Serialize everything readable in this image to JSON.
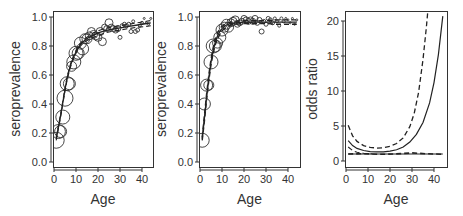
{
  "figure": {
    "width": 463,
    "height": 216,
    "background": "#ffffff",
    "ink": "#333333",
    "panel_count": 3
  },
  "chart_data": [
    {
      "type": "scatter",
      "panel": "left",
      "title": "",
      "xlabel": "Age",
      "ylabel": "seroprevalence",
      "xlim": [
        -1,
        44.5
      ],
      "ylim": [
        -0.04,
        1.07
      ],
      "xticks": [
        0,
        10,
        20,
        30,
        40
      ],
      "xtick_labels": [
        "0",
        "10",
        "20",
        "30",
        "40"
      ],
      "yticks": [
        0.0,
        0.2,
        0.4,
        0.6,
        0.8,
        1.0
      ],
      "ytick_labels": [
        "0.0",
        "0.2",
        "0.4",
        "0.6",
        "0.8",
        "1.0"
      ],
      "grid": false,
      "legend": null,
      "box": {
        "x0": 53,
        "y0": 11,
        "x1": 153,
        "y1": 167
      },
      "xmap": {
        "v0": 0,
        "p0": 54,
        "v1": 40,
        "p1": 142
      },
      "ymap": {
        "v0": 0,
        "p0": 162,
        "v1": 1,
        "p1": 17
      },
      "points": {
        "note": "open circles, radius proportional to sample size",
        "x": [
          1,
          2,
          3,
          4,
          5,
          6,
          7,
          8,
          9,
          10,
          11,
          12,
          13,
          14,
          15,
          16,
          17,
          18,
          19,
          20,
          21,
          22,
          23,
          24,
          25,
          26,
          27,
          28,
          29,
          30,
          31,
          32,
          33,
          34,
          35,
          36,
          37,
          38,
          39,
          40,
          41,
          42,
          43,
          44
        ],
        "y": [
          0.15,
          0.21,
          0.21,
          0.31,
          0.44,
          0.54,
          0.54,
          0.66,
          0.69,
          0.75,
          0.75,
          0.82,
          0.78,
          0.85,
          0.85,
          0.87,
          0.9,
          0.88,
          0.87,
          0.86,
          0.9,
          0.83,
          0.93,
          0.92,
          0.96,
          0.93,
          0.92,
          0.91,
          0.92,
          0.86,
          0.94,
          0.95,
          0.94,
          0.95,
          0.9,
          0.97,
          0.9,
          0.91,
          0.94,
          0.96,
          0.99,
          0.96,
          0.95,
          0.99
        ],
        "r": [
          8,
          7,
          6,
          7,
          8,
          7,
          6,
          5,
          7,
          7,
          6,
          6,
          6,
          5,
          5,
          4,
          4,
          4,
          4,
          4,
          4,
          4,
          3,
          3,
          4,
          3,
          3,
          3,
          3,
          2,
          2,
          2,
          2,
          2,
          2,
          1.5,
          2,
          2,
          1.5,
          1.5,
          1,
          1,
          1,
          1
        ]
      },
      "series": [
        {
          "name": "fit",
          "style": "solid",
          "width": 1.3,
          "x": [
            1,
            2,
            3,
            4,
            5,
            6,
            7,
            8,
            10,
            12,
            14,
            16,
            18,
            20,
            23,
            26,
            30,
            34,
            38,
            42,
            44
          ],
          "y": [
            0.16,
            0.24,
            0.32,
            0.41,
            0.5,
            0.58,
            0.64,
            0.69,
            0.76,
            0.81,
            0.84,
            0.86,
            0.875,
            0.89,
            0.905,
            0.915,
            0.925,
            0.935,
            0.945,
            0.955,
            0.96
          ]
        },
        {
          "name": "lower",
          "style": "dashed",
          "width": 1.1,
          "x": [
            1,
            2,
            3,
            4,
            5,
            6,
            7,
            8,
            10,
            12,
            14,
            16,
            18,
            20,
            23,
            26,
            30,
            34,
            38,
            42,
            44
          ],
          "y": [
            0.15,
            0.23,
            0.31,
            0.4,
            0.49,
            0.57,
            0.63,
            0.68,
            0.75,
            0.8,
            0.83,
            0.845,
            0.86,
            0.87,
            0.89,
            0.9,
            0.91,
            0.92,
            0.93,
            0.935,
            0.94
          ]
        },
        {
          "name": "upper",
          "style": "dashed",
          "width": 1.1,
          "x": [
            1,
            2,
            3,
            4,
            5,
            6,
            7,
            8,
            10,
            12,
            14,
            16,
            18,
            20,
            23,
            26,
            30,
            34,
            38,
            42,
            44
          ],
          "y": [
            0.17,
            0.25,
            0.33,
            0.42,
            0.51,
            0.59,
            0.65,
            0.7,
            0.77,
            0.82,
            0.85,
            0.87,
            0.89,
            0.905,
            0.92,
            0.93,
            0.94,
            0.95,
            0.96,
            0.97,
            0.975
          ]
        }
      ]
    },
    {
      "type": "scatter",
      "panel": "middle",
      "title": "",
      "xlabel": "Age",
      "ylabel": "seroprevalence",
      "xlim": [
        -1,
        44.5
      ],
      "ylim": [
        -0.04,
        1.07
      ],
      "xticks": [
        0,
        10,
        20,
        30,
        40
      ],
      "xtick_labels": [
        "0",
        "10",
        "20",
        "30",
        "40"
      ],
      "yticks": [
        0.0,
        0.2,
        0.4,
        0.6,
        0.8,
        1.0
      ],
      "ytick_labels": [
        "0.0",
        "0.2",
        "0.4",
        "0.6",
        "0.8",
        "1.0"
      ],
      "grid": false,
      "legend": null,
      "box": {
        "x0": 199,
        "y0": 11,
        "x1": 300,
        "y1": 167
      },
      "xmap": {
        "v0": 0,
        "p0": 200,
        "v1": 40,
        "p1": 288
      },
      "ymap": {
        "v0": 0,
        "p0": 162,
        "v1": 1,
        "p1": 17
      },
      "points": {
        "note": "open circles, radius proportional to sample size",
        "x": [
          1,
          2,
          3,
          4,
          5,
          6,
          7,
          8,
          9,
          10,
          11,
          12,
          13,
          14,
          15,
          16,
          17,
          18,
          19,
          20,
          21,
          22,
          23,
          24,
          25,
          26,
          27,
          28,
          29,
          30,
          31,
          32,
          33,
          34,
          35,
          36,
          37,
          38,
          39,
          40,
          41,
          42,
          43,
          44
        ],
        "y": [
          0.15,
          0.4,
          0.53,
          0.53,
          0.69,
          0.8,
          0.8,
          0.82,
          0.86,
          0.91,
          0.93,
          0.95,
          0.93,
          0.96,
          0.97,
          0.98,
          0.95,
          0.96,
          0.97,
          0.99,
          0.98,
          0.97,
          0.98,
          0.97,
          0.99,
          0.96,
          0.98,
          0.9,
          0.97,
          0.95,
          0.99,
          0.98,
          0.96,
          0.99,
          0.97,
          0.94,
          0.99,
          0.97,
          0.99,
          0.98,
          0.96,
          0.99,
          0.95,
          0.98
        ],
        "r": [
          7,
          6,
          6,
          5,
          7,
          7,
          6,
          5,
          6,
          6,
          5,
          5,
          5,
          4,
          4,
          4,
          3,
          3,
          3,
          3,
          3,
          3,
          3,
          3,
          3,
          2.5,
          2.5,
          2.5,
          2,
          2,
          2,
          2,
          2,
          1.5,
          1.5,
          1.5,
          1.5,
          1.5,
          1,
          1,
          1,
          1,
          1,
          1
        ]
      },
      "series": [
        {
          "name": "fit",
          "style": "solid",
          "width": 1.3,
          "x": [
            1,
            2,
            3,
            4,
            5,
            6,
            7,
            8,
            9,
            10,
            12,
            14,
            16,
            20,
            25,
            30,
            35,
            40,
            44
          ],
          "y": [
            0.16,
            0.3,
            0.45,
            0.58,
            0.69,
            0.77,
            0.83,
            0.87,
            0.9,
            0.92,
            0.945,
            0.955,
            0.96,
            0.965,
            0.965,
            0.965,
            0.965,
            0.965,
            0.965
          ]
        },
        {
          "name": "lower",
          "style": "dashed",
          "width": 1.4,
          "x": [
            1,
            2,
            3,
            4,
            5,
            6,
            7,
            8,
            9,
            10,
            12,
            14,
            16,
            20,
            25,
            30,
            35,
            40,
            44
          ],
          "y": [
            0.15,
            0.28,
            0.43,
            0.56,
            0.67,
            0.75,
            0.81,
            0.85,
            0.88,
            0.905,
            0.93,
            0.945,
            0.95,
            0.955,
            0.955,
            0.955,
            0.95,
            0.95,
            0.95
          ]
        },
        {
          "name": "upper",
          "style": "dashed",
          "width": 1.4,
          "x": [
            1,
            2,
            3,
            4,
            5,
            6,
            7,
            8,
            9,
            10,
            12,
            14,
            16,
            20,
            25,
            30,
            35,
            40,
            44
          ],
          "y": [
            0.17,
            0.32,
            0.47,
            0.6,
            0.71,
            0.79,
            0.85,
            0.89,
            0.92,
            0.935,
            0.955,
            0.965,
            0.97,
            0.975,
            0.975,
            0.975,
            0.98,
            0.98,
            0.98
          ]
        }
      ]
    },
    {
      "type": "line",
      "panel": "right",
      "title": "",
      "xlabel": "Age",
      "ylabel": "odds ratio",
      "xlim": [
        -1,
        45
      ],
      "ylim": [
        -0.8,
        21.5
      ],
      "xticks": [
        0,
        10,
        20,
        30,
        40
      ],
      "xtick_labels": [
        "0",
        "10",
        "20",
        "30",
        "40"
      ],
      "yticks": [
        0,
        5,
        10,
        15,
        20
      ],
      "ytick_labels": [
        "0",
        "5",
        "10",
        "15",
        "20"
      ],
      "grid": false,
      "legend": null,
      "box": {
        "x0": 345,
        "y0": 11,
        "x1": 447,
        "y1": 167
      },
      "xmap": {
        "v0": 0,
        "p0": 346,
        "v1": 40,
        "p1": 434
      },
      "ymap": {
        "v0": 0,
        "p0": 161,
        "v1": 20,
        "p1": 21
      },
      "series": [
        {
          "name": "odds ratio (solid)",
          "style": "solid",
          "width": 1.2,
          "x": [
            1,
            3,
            5,
            8,
            11,
            14,
            17,
            20,
            23,
            26,
            29,
            32,
            35,
            38,
            40,
            42,
            44
          ],
          "y": [
            2.9,
            2.2,
            1.8,
            1.5,
            1.35,
            1.3,
            1.3,
            1.4,
            1.6,
            2.0,
            2.7,
            3.8,
            5.5,
            8.3,
            11.2,
            15.2,
            20.7
          ]
        },
        {
          "name": "odds ratio upper (dashed)",
          "style": "dashed",
          "width": 1.3,
          "x": [
            1,
            3,
            5,
            8,
            11,
            14,
            17,
            20,
            23,
            26,
            29,
            31,
            33,
            35,
            36.5,
            37.5
          ],
          "y": [
            5.1,
            3.6,
            2.8,
            2.2,
            1.95,
            1.85,
            1.9,
            2.1,
            2.5,
            3.3,
            4.9,
            6.8,
            9.8,
            14.5,
            19.0,
            22.5
          ]
        },
        {
          "name": "odds ratio lower (dashed)",
          "style": "dashed",
          "width": 1.1,
          "x": [
            1,
            3,
            5,
            8,
            12
          ],
          "y": [
            2.0,
            1.5,
            1.25,
            1.1,
            1.02
          ]
        },
        {
          "name": "reference OR = 1",
          "style": "solid",
          "width": 1.1,
          "x": [
            1,
            44
          ],
          "y": [
            1.0,
            1.0
          ]
        },
        {
          "name": "constant-OR fit (dashed)",
          "style": "dashed",
          "width": 1.6,
          "x": [
            1,
            8,
            15,
            22,
            30,
            36,
            44
          ],
          "y": [
            1.0,
            1.05,
            0.95,
            1.0,
            1.15,
            1.05,
            0.95
          ]
        }
      ]
    }
  ]
}
